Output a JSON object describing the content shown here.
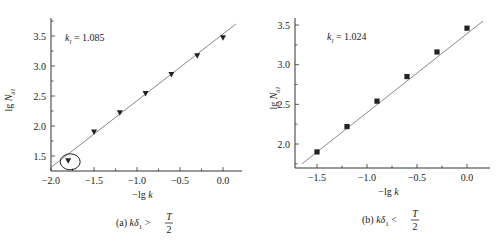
{
  "chart_data": [
    {
      "type": "scatter",
      "id": "a",
      "title": "",
      "caption": "(a) kδ1 > T/2",
      "caption_parts": {
        "prefix": "(a) ",
        "expr": "kδ",
        "sub": "1",
        "op": ">",
        "num": "T",
        "den": "2"
      },
      "xlabel": "−lg k",
      "ylabel": "lg N",
      "ylabel_sub": "δ1",
      "annotation": {
        "label": "k",
        "sub": "l",
        "text": " = 1.085",
        "value": 1.085
      },
      "xlim": [
        -2.0,
        0.2
      ],
      "ylim": [
        1.25,
        3.75
      ],
      "xticks": [
        "−2.0",
        "−1.5",
        "−1.0",
        "−0.5",
        "0.0"
      ],
      "xtick_values": [
        -2.0,
        -1.5,
        -1.0,
        -0.5,
        0.0
      ],
      "yticks": [
        "1.5",
        "2.0",
        "2.5",
        "3.0",
        "3.5"
      ],
      "ytick_values": [
        1.5,
        2.0,
        2.5,
        3.0,
        3.5
      ],
      "marker": "inverted-triangle",
      "x": [
        -1.8,
        -1.5,
        -1.2,
        -0.9,
        -0.6,
        -0.3,
        0.0
      ],
      "y": [
        1.42,
        1.9,
        2.22,
        2.54,
        2.86,
        3.17,
        3.47
      ],
      "highlighted_point_index": 0,
      "highlight": "circled outlier",
      "fit_line": {
        "x": [
          -2.0,
          0.15
        ],
        "y": [
          1.31,
          3.7
        ]
      },
      "grid": false
    },
    {
      "type": "scatter",
      "id": "b",
      "title": "",
      "caption": "(b) kδ1 < T/2",
      "caption_parts": {
        "prefix": "(b) ",
        "expr": "kδ",
        "sub": "1",
        "op": "<",
        "num": "T",
        "den": "2"
      },
      "xlabel": "−lg k",
      "ylabel": "lg N",
      "ylabel_sub": "δ1",
      "annotation": {
        "label": "k",
        "sub": "l",
        "text": " = 1.024",
        "value": 1.024
      },
      "xlim": [
        -1.72,
        0.23
      ],
      "ylim": [
        1.7,
        3.6
      ],
      "xticks": [
        "−1.5",
        "−1.0",
        "−0.5",
        "0.0"
      ],
      "xtick_values": [
        -1.5,
        -1.0,
        -0.5,
        0.0
      ],
      "yticks": [
        "2.0",
        "2.5",
        "3.0",
        "3.5"
      ],
      "ytick_values": [
        2.0,
        2.5,
        3.0,
        3.5
      ],
      "marker": "square",
      "x": [
        -1.5,
        -1.2,
        -0.9,
        -0.6,
        -0.3,
        0.0
      ],
      "y": [
        1.9,
        2.22,
        2.54,
        2.85,
        3.16,
        3.46
      ],
      "fit_line": {
        "x": [
          -1.65,
          0.16
        ],
        "y": [
          1.75,
          3.55
        ]
      },
      "grid": false
    }
  ]
}
